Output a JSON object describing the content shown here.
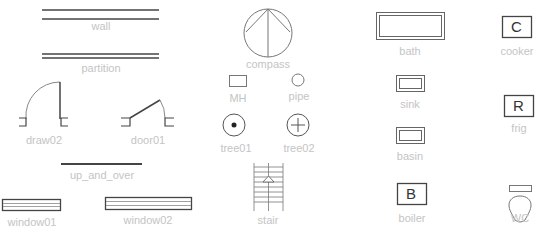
{
  "colors": {
    "stroke": "#444444",
    "thin_stroke": "#888888",
    "label": "#c4c4c4",
    "background": "#ffffff"
  },
  "symbols": [
    {
      "id": "wall",
      "label": "wall"
    },
    {
      "id": "partition",
      "label": "partition"
    },
    {
      "id": "draw02",
      "label": "draw02"
    },
    {
      "id": "door01",
      "label": "door01"
    },
    {
      "id": "up_and_over",
      "label": "up_and_over"
    },
    {
      "id": "window01",
      "label": "window01"
    },
    {
      "id": "window02",
      "label": "window02"
    },
    {
      "id": "compass",
      "label": "compass"
    },
    {
      "id": "mh",
      "label": "MH"
    },
    {
      "id": "pipe",
      "label": "pipe"
    },
    {
      "id": "tree01",
      "label": "tree01"
    },
    {
      "id": "tree02",
      "label": "tree02"
    },
    {
      "id": "stair",
      "label": "stair"
    },
    {
      "id": "bath",
      "label": "bath"
    },
    {
      "id": "sink",
      "label": "sink"
    },
    {
      "id": "basin",
      "label": "basin"
    },
    {
      "id": "boiler",
      "label": "boiler",
      "glyph": "B"
    },
    {
      "id": "cooker",
      "label": "cooker",
      "glyph": "C"
    },
    {
      "id": "frig",
      "label": "frig",
      "glyph": "R"
    },
    {
      "id": "wc",
      "label": "WC"
    }
  ]
}
